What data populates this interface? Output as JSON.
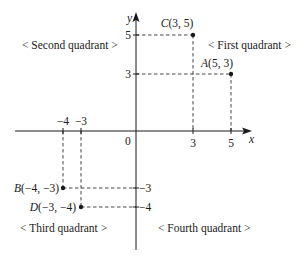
{
  "diagram": {
    "axes": {
      "x_label": "x",
      "y_label": "y",
      "origin_label": "0",
      "x_ticks": [
        {
          "value": -4,
          "label": "−4"
        },
        {
          "value": -3,
          "label": "−3"
        },
        {
          "value": 3,
          "label": "3"
        },
        {
          "value": 5,
          "label": "5"
        }
      ],
      "y_ticks": [
        {
          "value": 5,
          "label": "5"
        },
        {
          "value": 3,
          "label": "3"
        },
        {
          "value": -3,
          "label": "−3"
        },
        {
          "value": -4,
          "label": "−4"
        }
      ]
    },
    "points": [
      {
        "name": "C",
        "coords": "(3, 5)",
        "x": 3,
        "y": 5
      },
      {
        "name": "A",
        "coords": "(5, 3)",
        "x": 5,
        "y": 3
      },
      {
        "name": "B",
        "coords": "(−4, −3)",
        "x": -4,
        "y": -3
      },
      {
        "name": "D",
        "coords": "(−3, −4)",
        "x": -3,
        "y": -4
      }
    ],
    "quadrants": {
      "first": "< First quadrant >",
      "second": "< Second quadrant >",
      "third": "< Third quadrant >",
      "fourth": "< Fourth quadrant >"
    },
    "colors": {
      "ink": "#1a1a1a",
      "background": "#ffffff"
    }
  }
}
